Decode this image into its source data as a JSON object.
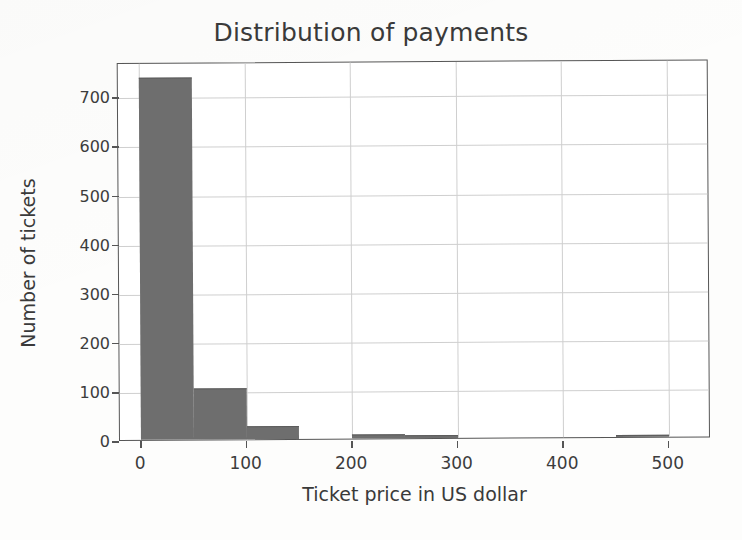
{
  "chart_data": {
    "type": "bar",
    "title": "Distribution of payments",
    "xlabel": "Ticket price in US dollar",
    "ylabel": "Number of tickets",
    "grid": true,
    "legend": null,
    "bin_width": 50,
    "xlim": [
      -20,
      540
    ],
    "ylim": [
      0,
      770
    ],
    "xticks": [
      0,
      100,
      200,
      300,
      400,
      500
    ],
    "xtick_labels": [
      "0",
      "100",
      "200",
      "300",
      "400",
      "500"
    ],
    "yticks": [
      0,
      100,
      200,
      300,
      400,
      500,
      600,
      700
    ],
    "ytick_labels": [
      "0",
      "100",
      "200",
      "300",
      "400",
      "500",
      "600",
      "700"
    ],
    "bar_color": "#6e6e6e",
    "bins": [
      {
        "x0": 0,
        "x1": 50,
        "value": 735
      },
      {
        "x0": 50,
        "x1": 100,
        "value": 102
      },
      {
        "x0": 100,
        "x1": 150,
        "value": 25
      },
      {
        "x0": 150,
        "x1": 200,
        "value": 0
      },
      {
        "x0": 200,
        "x1": 250,
        "value": 6
      },
      {
        "x0": 250,
        "x1": 300,
        "value": 5
      },
      {
        "x0": 300,
        "x1": 350,
        "value": 0
      },
      {
        "x0": 350,
        "x1": 400,
        "value": 0
      },
      {
        "x0": 400,
        "x1": 450,
        "value": 0
      },
      {
        "x0": 450,
        "x1": 500,
        "value": 2
      }
    ],
    "categories": [
      "0-50",
      "50-100",
      "100-150",
      "150-200",
      "200-250",
      "250-300",
      "300-350",
      "350-400",
      "400-450",
      "450-500"
    ],
    "values": [
      735,
      102,
      25,
      0,
      6,
      5,
      0,
      0,
      0,
      2
    ]
  }
}
